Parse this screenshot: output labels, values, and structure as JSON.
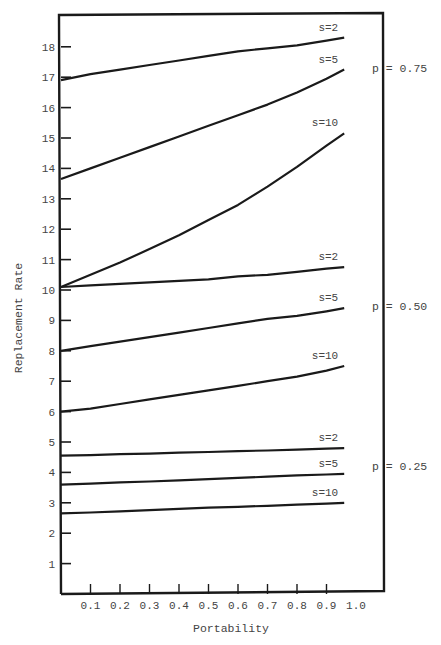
{
  "chart_data": {
    "type": "line",
    "title": "",
    "xlabel": "Portability",
    "ylabel": "Replacement Rate",
    "xlim": [
      0.0,
      1.0
    ],
    "ylim": [
      0,
      19
    ],
    "x_ticks": [
      "0.1",
      "0.2",
      "0.3",
      "0.4",
      "0.5",
      "0.6",
      "0.7",
      "0.8",
      "0.9",
      "1.0"
    ],
    "y_ticks": [
      "1",
      "2",
      "3",
      "4",
      "5",
      "6",
      "7",
      "8",
      "9",
      "10",
      "11",
      "12",
      "13",
      "14",
      "15",
      "16",
      "17",
      "18"
    ],
    "grid": false,
    "legend_position": "inline labels at right end of lines; group labels outside right border",
    "x": [
      0.0,
      0.1,
      0.2,
      0.3,
      0.4,
      0.5,
      0.6,
      0.7,
      0.8,
      0.9,
      0.96
    ],
    "groups": [
      {
        "label": "p = 0.75",
        "series": [
          {
            "name": "s=2",
            "values": [
              16.9,
              17.1,
              17.25,
              17.4,
              17.55,
              17.7,
              17.85,
              17.95,
              18.05,
              18.2,
              18.3
            ]
          },
          {
            "name": "s=5",
            "values": [
              13.65,
              14.0,
              14.35,
              14.7,
              15.05,
              15.4,
              15.75,
              16.1,
              16.5,
              16.95,
              17.25
            ]
          },
          {
            "name": "s=10",
            "values": [
              10.1,
              10.5,
              10.9,
              11.35,
              11.8,
              12.3,
              12.8,
              13.4,
              14.05,
              14.75,
              15.15
            ]
          }
        ]
      },
      {
        "label": "p = 0.50",
        "series": [
          {
            "name": "s=2",
            "values": [
              10.1,
              10.15,
              10.2,
              10.25,
              10.3,
              10.35,
              10.45,
              10.5,
              10.6,
              10.7,
              10.75
            ]
          },
          {
            "name": "s=5",
            "values": [
              8.0,
              8.15,
              8.3,
              8.45,
              8.6,
              8.75,
              8.9,
              9.05,
              9.15,
              9.3,
              9.4
            ]
          },
          {
            "name": "s=10",
            "values": [
              6.0,
              6.1,
              6.25,
              6.4,
              6.55,
              6.7,
              6.85,
              7.0,
              7.15,
              7.35,
              7.5
            ]
          }
        ]
      },
      {
        "label": "p = 0.25",
        "series": [
          {
            "name": "s=2",
            "values": [
              4.55,
              4.57,
              4.6,
              4.62,
              4.65,
              4.67,
              4.7,
              4.72,
              4.75,
              4.78,
              4.8
            ]
          },
          {
            "name": "s=5",
            "values": [
              3.6,
              3.63,
              3.67,
              3.7,
              3.74,
              3.78,
              3.82,
              3.86,
              3.9,
              3.93,
              3.95
            ]
          },
          {
            "name": "s=10",
            "values": [
              2.65,
              2.68,
              2.72,
              2.76,
              2.8,
              2.84,
              2.87,
              2.9,
              2.94,
              2.97,
              3.0
            ]
          }
        ]
      }
    ]
  },
  "colors": {
    "line": "#1a1a1a",
    "text": "#444444",
    "background": "#ffffff"
  }
}
